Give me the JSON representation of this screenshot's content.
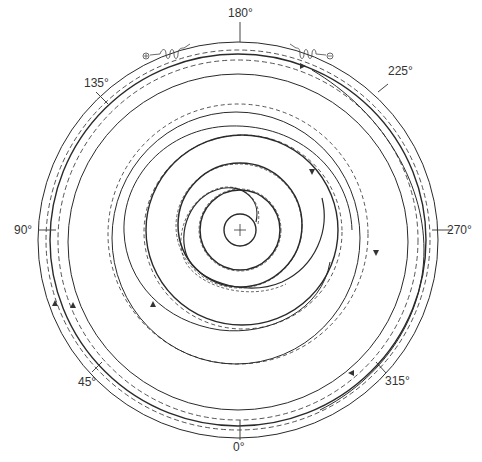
{
  "diagram": {
    "type": "polar spiral trajectory plot",
    "center": {
      "x": 240,
      "y": 230
    },
    "angle_labels": [
      {
        "text": "180°",
        "angle": 180
      },
      {
        "text": "225°",
        "angle": 225
      },
      {
        "text": "270°",
        "angle": 270
      },
      {
        "text": "315°",
        "angle": 315
      },
      {
        "text": "0°",
        "angle": 0
      },
      {
        "text": "45°",
        "angle": 45
      },
      {
        "text": "90°",
        "angle": 90
      },
      {
        "text": "135°",
        "angle": 135
      }
    ],
    "particles": {
      "positive": {
        "symbol": "⊕",
        "label": "positive particle"
      },
      "negative": {
        "symbol": "⊖",
        "label": "negative particle"
      }
    },
    "center_marker": "+",
    "line_styles": {
      "solid": "#2a2a2a",
      "dashed": "#3a3a3a"
    }
  }
}
